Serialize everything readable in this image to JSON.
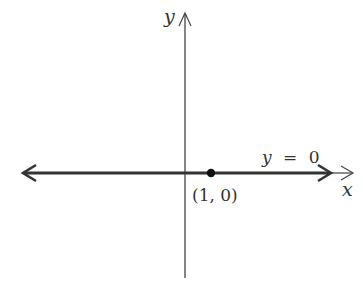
{
  "diagram": {
    "type": "coordinate-plane",
    "axes": {
      "x_label": "x",
      "y_label": "y"
    },
    "line": {
      "equation_label_lhs": "y",
      "equation_label_eq": "=",
      "equation_label_rhs": "0",
      "description": "horizontal line along x-axis, arrows both ends"
    },
    "point": {
      "label": "(1, 0)",
      "x": 1,
      "y": 0
    },
    "colors": {
      "axis": "#444444",
      "line": "#333333",
      "point": "#111111",
      "text": "#333333"
    }
  }
}
